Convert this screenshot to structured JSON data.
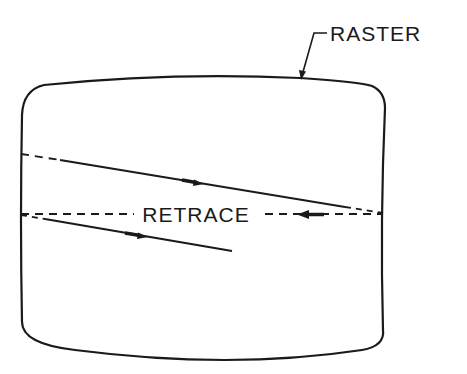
{
  "diagram": {
    "type": "crt-raster-scan",
    "labels": {
      "raster": "RASTER",
      "retrace": "RETRACE"
    },
    "colors": {
      "ink": "#1a1a1a",
      "background": "#ffffff"
    },
    "elements": [
      {
        "name": "screen-outline",
        "shape": "rounded-barrel-rectangle"
      },
      {
        "name": "scan-line-1",
        "style": "solid with dashed ends",
        "direction": "left-to-right"
      },
      {
        "name": "retrace-line",
        "style": "dashed",
        "direction": "right-to-left"
      },
      {
        "name": "scan-line-2",
        "style": "solid",
        "direction": "left-to-right"
      },
      {
        "name": "raster-leader",
        "points_to": "screen-outline"
      }
    ]
  }
}
